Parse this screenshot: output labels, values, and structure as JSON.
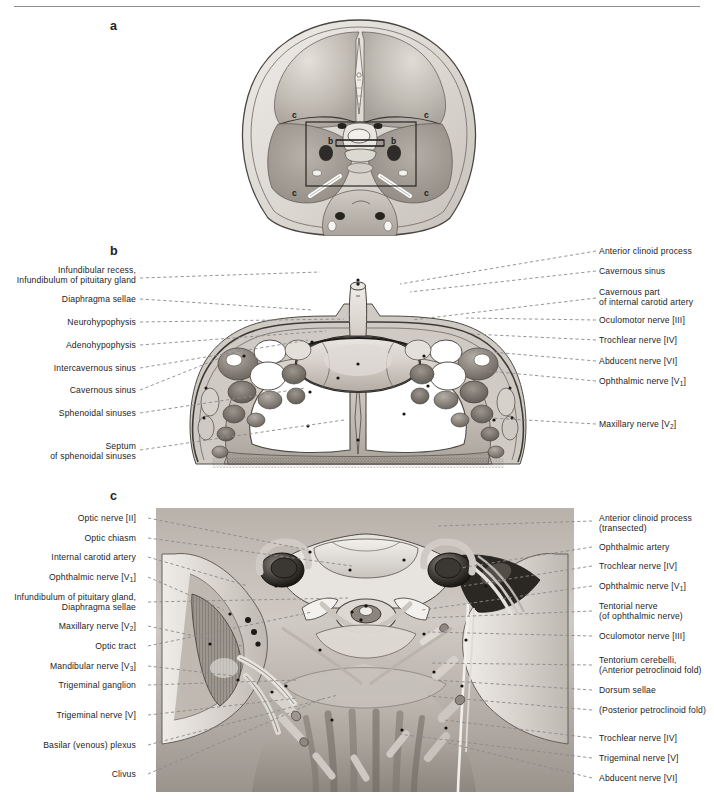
{
  "figure": {
    "panels": [
      {
        "id": "a",
        "letter": "a",
        "caption": "Superior view of cranial base showing planes of sections b and c"
      },
      {
        "id": "b",
        "letter": "b",
        "caption": "Coronal section through the sella turcica and cavernous sinuses"
      },
      {
        "id": "c",
        "letter": "c",
        "caption": "Superior view of the middle cranial fossa, dura removed"
      }
    ],
    "panel_a_markers": [
      "c",
      "c",
      "b",
      "b",
      "c",
      "c"
    ]
  },
  "panel_b": {
    "left_labels": [
      {
        "lines": [
          "Infundibular recess,",
          "Infundibulum of pituitary gland"
        ],
        "y": 272,
        "tx": 324,
        "ty": 276
      },
      {
        "lines": [
          "Diaphragma sellae"
        ],
        "y": 301,
        "tx": 316,
        "ty": 312
      },
      {
        "lines": [
          "Neurohypophysis"
        ],
        "y": 324,
        "tx": 348,
        "ty": 322
      },
      {
        "lines": [
          "Adenohypophysis"
        ],
        "y": 347,
        "tx": 330,
        "ty": 334
      },
      {
        "lines": [
          "Intercavernous sinus"
        ],
        "y": 370,
        "tx": 312,
        "ty": 342
      },
      {
        "lines": [
          "Cavernous sinus"
        ],
        "y": 392,
        "tx": 244,
        "ty": 352
      },
      {
        "lines": [
          "Sphenoidal sinuses"
        ],
        "y": 415,
        "tx": 310,
        "ty": 392
      },
      {
        "lines": [
          "Septum",
          "of sphenoidal sinuses"
        ],
        "y": 448,
        "tx": 348,
        "ty": 424
      }
    ],
    "right_labels": [
      {
        "lines": [
          "Anterior clinoid process"
        ],
        "y": 253,
        "tx": 400,
        "ty": 286
      },
      {
        "lines": [
          "Cavernous sinus"
        ],
        "y": 273,
        "tx": 412,
        "ty": 294
      },
      {
        "lines": [
          "Cavernous part",
          "of internal carotid artery"
        ],
        "y": 294,
        "tx": 413,
        "ty": 322
      },
      {
        "lines": [
          "Oculomotor nerve [III]"
        ],
        "y": 322,
        "tx": 468,
        "ty": 320
      },
      {
        "lines": [
          "Trochlear nerve [IV]"
        ],
        "y": 342,
        "tx": 474,
        "ty": 336
      },
      {
        "lines": [
          "Abducent nerve [VI]"
        ],
        "y": 363,
        "tx": 470,
        "ty": 352
      },
      {
        "lines": [
          "Ophthalmic nerve [V<sub>1</sub>]"
        ],
        "y": 383,
        "tx": 478,
        "ty": 372
      },
      {
        "lines": [
          "Maxillary nerve [V<sub>2</sub>]"
        ],
        "y": 426,
        "tx": 492,
        "ty": 420
      }
    ]
  },
  "panel_c": {
    "left_labels": [
      {
        "lines": [
          "Optic nerve [II]"
        ],
        "y": 520,
        "tx": 310,
        "ty": 552
      },
      {
        "lines": [
          "Optic chiasm"
        ],
        "y": 540,
        "tx": 356,
        "ty": 568
      },
      {
        "lines": [
          "Internal carotid artery"
        ],
        "y": 559,
        "tx": 250,
        "ty": 588
      },
      {
        "lines": [
          "Ophthalmic nerve [V<sub>1</sub>]"
        ],
        "y": 579,
        "tx": 226,
        "ty": 612
      },
      {
        "lines": [
          "Infundibulum of pituitary gland,",
          "Diaphragma sellae"
        ],
        "y": 599,
        "tx": 350,
        "ty": 600
      },
      {
        "lines": [
          "Maxillary nerve [V<sub>2</sub>]"
        ],
        "y": 628,
        "tx": 244,
        "ty": 648
      },
      {
        "lines": [
          "Optic tract"
        ],
        "y": 648,
        "tx": 314,
        "ty": 614
      },
      {
        "lines": [
          "Mandibular nerve [V<sub>3</sub>]"
        ],
        "y": 668,
        "tx": 236,
        "ty": 678
      },
      {
        "lines": [
          "Trigeminal ganglion"
        ],
        "y": 687,
        "tx": 300,
        "ty": 682
      },
      {
        "lines": [
          "Trigeminal nerve [V]"
        ],
        "y": 717,
        "tx": 300,
        "ty": 700
      },
      {
        "lines": [
          "Basilar (venous) plexus"
        ],
        "y": 747,
        "tx": 340,
        "ty": 697
      },
      {
        "lines": [
          "Clivus"
        ],
        "y": 776,
        "tx": 326,
        "ty": 700
      }
    ],
    "right_labels": [
      {
        "lines": [
          "Anterior clinoid process",
          "(transected)"
        ],
        "y": 520,
        "tx": 440,
        "ty": 528
      },
      {
        "lines": [
          "Ophthalmic artery"
        ],
        "y": 549,
        "tx": 462,
        "ty": 570
      },
      {
        "lines": [
          "Trochlear nerve [IV]"
        ],
        "y": 568,
        "tx": 466,
        "ty": 588
      },
      {
        "lines": [
          "Ophthalmic nerve [V<sub>1</sub>]"
        ],
        "y": 588,
        "tx": 424,
        "ty": 612
      },
      {
        "lines": [
          "Tentorial nerve",
          "(of ophthalmic nerve)"
        ],
        "y": 608,
        "tx": 426,
        "ty": 620
      },
      {
        "lines": [
          "Oculomotor nerve [III]"
        ],
        "y": 638,
        "tx": 430,
        "ty": 634
      },
      {
        "lines": [
          "Tentorium cerebelli,",
          "(Anterior petroclinoid fold)"
        ],
        "y": 662,
        "tx": 432,
        "ty": 665
      },
      {
        "lines": [
          "Dorsum sellae"
        ],
        "y": 692,
        "tx": 436,
        "ty": 682
      },
      {
        "lines": [
          "(Posterior petroclinoid fold)"
        ],
        "y": 712,
        "tx": 430,
        "ty": 698
      },
      {
        "lines": [
          "Trochlear nerve [IV]"
        ],
        "y": 740,
        "tx": 446,
        "ty": 722
      },
      {
        "lines": [
          "Trigeminal nerve [V]"
        ],
        "y": 760,
        "tx": 400,
        "ty": 736
      },
      {
        "lines": [
          "Abducent nerve [VI]"
        ],
        "y": 780,
        "tx": 450,
        "ty": 745
      }
    ]
  },
  "colors": {
    "leader": "#8a8a8a",
    "text": "#1d1d1d",
    "rule": "#8d8d8d",
    "tissue_light": "#d9d5d0",
    "tissue_mid": "#b4aea7",
    "tissue_dark": "#8a847d",
    "bone": "#c9c4bd",
    "lumen": "#ffffff",
    "vessel_dark": "#6a6560"
  }
}
